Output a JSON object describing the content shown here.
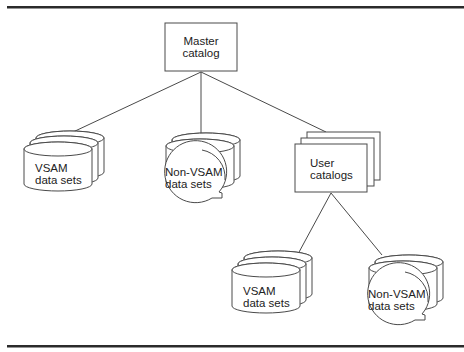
{
  "diagram": {
    "root": {
      "line1": "Master",
      "line2": "catalog"
    },
    "children": {
      "vsam_left": {
        "line1": "VSAM",
        "line2": "data sets"
      },
      "nonvsam_left": {
        "line1": "Non-VSAM",
        "line2": "data sets"
      },
      "user_catalogs": {
        "line1": "User",
        "line2": "catalogs"
      }
    },
    "grandchildren": {
      "vsam_right": {
        "line1": "VSAM",
        "line2": "data sets"
      },
      "nonvsam_right": {
        "line1": "Non-VSAM",
        "line2": "data sets"
      }
    },
    "colors": {
      "stroke": "#4a4a4a",
      "rule": "#2b2b2b",
      "background": "#ffffff"
    }
  }
}
